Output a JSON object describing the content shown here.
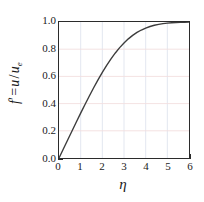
{
  "chart_data": {
    "type": "line",
    "title": "",
    "xlabel": "η",
    "ylabel_parts": {
      "symbol": "f",
      "prime": "′",
      "equals": "=",
      "numerator": "u",
      "slash": "/",
      "denominator": "u",
      "denominator_sub": "e"
    },
    "ylabel_plain": "f′ = u / u_e",
    "xlim": [
      0,
      6
    ],
    "ylim": [
      0.0,
      1.0
    ],
    "xticks": [
      0,
      1,
      2,
      3,
      4,
      5,
      6
    ],
    "xtick_labels": [
      "0",
      "1",
      "2",
      "3",
      "4",
      "5",
      "6"
    ],
    "xminor_step": 0.5,
    "yticks": [
      0.0,
      0.2,
      0.4,
      0.6,
      0.8,
      1.0
    ],
    "ytick_labels": [
      "0.0",
      "0.2",
      "0.4",
      "0.6",
      "0.8",
      "1.0"
    ],
    "yminor_step": 0.1,
    "grid": true,
    "grid_color_vertical": "#dfe4ee",
    "grid_color_horizontal": "#f2dede",
    "legend": null,
    "line_color": "#3c3c3c",
    "line_width": 1.4,
    "series": [
      {
        "name": "Blasius f'(η)",
        "x": [
          0.0,
          0.2,
          0.4,
          0.6,
          0.8,
          1.0,
          1.2,
          1.4,
          1.6,
          1.8,
          2.0,
          2.2,
          2.4,
          2.6,
          2.8,
          3.0,
          3.2,
          3.4,
          3.6,
          3.8,
          4.0,
          4.2,
          4.4,
          4.6,
          4.8,
          5.0,
          5.2,
          5.4,
          5.6,
          5.8,
          6.0
        ],
        "y": [
          0.0,
          0.0664,
          0.1328,
          0.1989,
          0.2647,
          0.3298,
          0.3938,
          0.4563,
          0.5168,
          0.5748,
          0.6298,
          0.6813,
          0.729,
          0.7725,
          0.8115,
          0.8461,
          0.8761,
          0.9018,
          0.9233,
          0.9411,
          0.9555,
          0.967,
          0.9759,
          0.9827,
          0.9878,
          0.9916,
          0.9943,
          0.9962,
          0.9975,
          0.9984,
          0.999
        ]
      }
    ]
  },
  "axis_frame": {
    "border_color": "#2b2b2b",
    "background": "#ffffff"
  }
}
